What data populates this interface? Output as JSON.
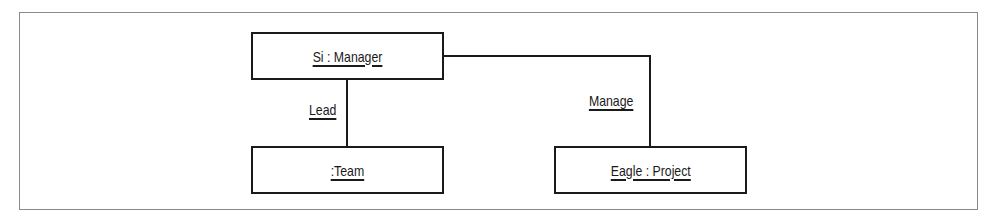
{
  "diagram": {
    "type": "UML object diagram",
    "objects": [
      {
        "id": "manager",
        "label": "Si : Manager"
      },
      {
        "id": "team",
        "label": ":Team"
      },
      {
        "id": "project",
        "label": "Eagle : Project"
      }
    ],
    "links": [
      {
        "from": "manager",
        "to": "team",
        "label": "Lead"
      },
      {
        "from": "manager",
        "to": "project",
        "label": "Manage"
      }
    ],
    "colors": {
      "line": "#1a1a1a",
      "frame": "#8a8a8a",
      "background": "#ffffff"
    }
  }
}
